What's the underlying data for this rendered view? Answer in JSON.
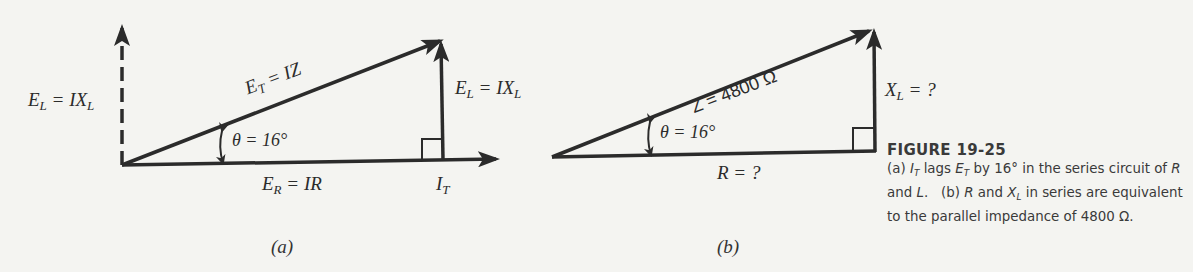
{
  "figure": {
    "number_label": "FIGURE 19-25",
    "caption_lines": [
      "(a) I_T lags E_T by 16° in the series",
      "circuit of R and L.   (b) R and X_L in",
      "series are equivalent to the parallel",
      "impedance of 4800 Ω."
    ],
    "caption": {
      "part_a_prefix": "(a) ",
      "part_a_i": "I",
      "part_a_i_sub": "T",
      "part_a_mid": " lags ",
      "part_a_e": "E",
      "part_a_e_sub": "T",
      "part_a_rest": " by 16° in the series circuit of ",
      "part_a_r": "R",
      "part_a_and": " and ",
      "part_a_l": "L",
      "part_a_end": ".",
      "part_b_prefix": "   (b) ",
      "part_b_r": "R",
      "part_b_and": " and ",
      "part_b_x": "X",
      "part_b_x_sub": "L",
      "part_b_rest": " in series are equivalent to the parallel impedance of 4800 Ω."
    }
  },
  "diagram_a": {
    "panel_label": "(a)",
    "el_dashed_label": {
      "main": "E",
      "sub": "L",
      "eq": " = IX",
      "eq_sub": "L"
    },
    "hypotenuse_label": {
      "main": "E",
      "sub": "T",
      "eq": " = IZ"
    },
    "vertical_label": {
      "main": "E",
      "sub": "L",
      "eq": " = IX",
      "eq_sub": "L"
    },
    "angle_label": "θ = 16°",
    "base_label": {
      "main": "E",
      "sub": "R",
      "eq": " = IR"
    },
    "current_label": {
      "main": "I",
      "sub": "T"
    },
    "angle_deg": 16
  },
  "diagram_b": {
    "panel_label": "(b)",
    "hypotenuse_label": "Z = 4800 Ω",
    "vertical_label": {
      "main": "X",
      "sub": "L",
      "eq": " = ?"
    },
    "angle_label": "θ = 16°",
    "base_label": "R = ?",
    "impedance_ohms": 4800,
    "angle_deg": 16
  },
  "colors": {
    "background": "#f4f4f1",
    "ink": "#2b2b2b"
  }
}
